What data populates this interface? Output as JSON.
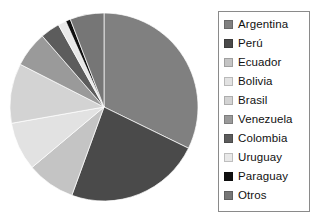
{
  "chart_data": {
    "type": "pie",
    "title": "",
    "xlabel": "",
    "ylabel": "",
    "legend_position": "right",
    "grid": false,
    "categories": [
      "Argentina",
      "Perú",
      "Ecuador",
      "Bolivia",
      "Brasil",
      "Venezuela",
      "Colombia",
      "Uruguay",
      "Paraguay",
      "Otros"
    ],
    "values": [
      32.2,
      23.3,
      8.3,
      8.3,
      10.3,
      6.1,
      3.3,
      1.4,
      0.8,
      6.0
    ],
    "units": "percent",
    "start_angle_deg": 0,
    "direction": "clockwise",
    "slices": [
      {
        "label": "Argentina",
        "value": 32.2,
        "angle_deg": 116,
        "color": "#808080"
      },
      {
        "label": "Perú",
        "value": 23.3,
        "angle_deg": 84,
        "color": "#4a4a4a"
      },
      {
        "label": "Ecuador",
        "value": 8.3,
        "angle_deg": 30,
        "color": "#c4c4c4"
      },
      {
        "label": "Bolivia",
        "value": 8.3,
        "angle_deg": 30,
        "color": "#e2e2e2"
      },
      {
        "label": "Brasil",
        "value": 10.3,
        "angle_deg": 37,
        "color": "#d3d3d3"
      },
      {
        "label": "Venezuela",
        "value": 6.1,
        "angle_deg": 22,
        "color": "#9a9a9a"
      },
      {
        "label": "Colombia",
        "value": 3.3,
        "angle_deg": 12,
        "color": "#5c5c5c"
      },
      {
        "label": "Uruguay",
        "value": 1.4,
        "angle_deg": 5,
        "color": "#e8e8e8"
      },
      {
        "label": "Paraguay",
        "value": 0.8,
        "angle_deg": 3,
        "color": "#101010"
      },
      {
        "label": "Otros",
        "value": 6.0,
        "angle_deg": 21,
        "color": "#767676"
      }
    ],
    "geometry": {
      "cx": 95,
      "cy": 95,
      "r": 94
    }
  },
  "legend": {
    "items": [
      {
        "label": "Argentina",
        "color": "#808080"
      },
      {
        "label": "Perú",
        "color": "#4a4a4a"
      },
      {
        "label": "Ecuador",
        "color": "#c4c4c4"
      },
      {
        "label": "Bolivia",
        "color": "#e2e2e2"
      },
      {
        "label": "Brasil",
        "color": "#d3d3d3"
      },
      {
        "label": "Venezuela",
        "color": "#9a9a9a"
      },
      {
        "label": "Colombia",
        "color": "#5c5c5c"
      },
      {
        "label": "Uruguay",
        "color": "#e8e8e8"
      },
      {
        "label": "Paraguay",
        "color": "#101010"
      },
      {
        "label": "Otros",
        "color": "#767676"
      }
    ]
  }
}
